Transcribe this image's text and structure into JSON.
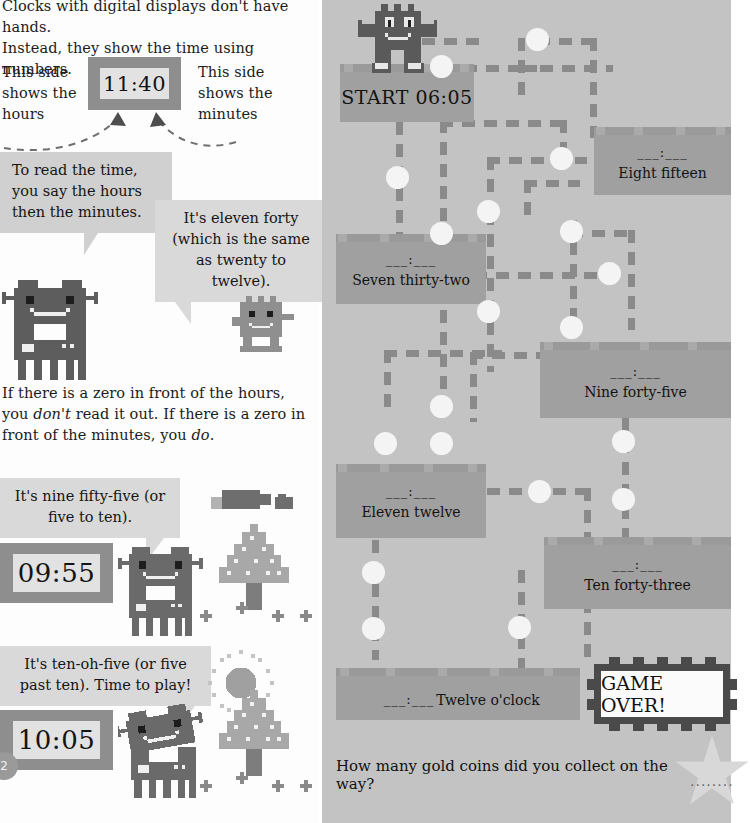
{
  "left_panel": {
    "intro_line1": "Clocks with digital displays don't have hands.",
    "intro_line2": "Instead, they show the time using numbers.",
    "label_hours": "This side shows the hours",
    "label_minutes": "This side shows the minutes",
    "clock_top_value": "11:40",
    "bubble_read_text": "To read the time, you say the hours then the minutes.",
    "bubble_eleven_text": "It's eleven forty (which is the same as twenty to twelve).",
    "zero_rule_part1": "If there is a zero in front of the hours, you ",
    "zero_rule_emph1": "don't",
    "zero_rule_part2": " read it out. If there is a zero in front of the minutes, you ",
    "zero_rule_emph2": "do",
    "zero_rule_part3": ".",
    "bubble_nine_text": "It's nine fifty-five (or five to ten).",
    "clock_0955_value": "09:55",
    "bubble_ten_text": "It's ten-oh-five (or five past ten). Time to play!",
    "clock_1005_value": "10:05",
    "page_number": "2"
  },
  "maze": {
    "platforms": [
      {
        "id": "start",
        "blank": "",
        "label": "START 06:05",
        "is_start": true
      },
      {
        "id": "eight",
        "blank": "___:___",
        "label": "Eight fifteen",
        "is_start": false
      },
      {
        "id": "seven",
        "blank": "___:___",
        "label": "Seven thirty-two",
        "is_start": false
      },
      {
        "id": "nine",
        "blank": "___:___",
        "label": "Nine forty-five",
        "is_start": false
      },
      {
        "id": "eleven",
        "blank": "___:___",
        "label": "Eleven twelve",
        "is_start": false
      },
      {
        "id": "ten",
        "blank": "___:___",
        "label": "Ten forty-three",
        "is_start": false
      },
      {
        "id": "twelve",
        "blank": "___:___",
        "label": "Twelve o'clock",
        "is_start": false
      }
    ],
    "game_over_label": "GAME OVER!",
    "question": "How many gold coins did you collect on the way?",
    "answer_dots": "........",
    "coin_count_visible": 19
  },
  "colors": {
    "page_background": "#ffffff",
    "maze_background": "#c3c3c3",
    "platform": "#a0a0a0",
    "platform_top": "#9a9a9a",
    "path_dash": "#8a8a8a",
    "coin": "#f4f4f4",
    "bubble": "#d9d9d9",
    "bubble_dark": "#d0d0d0",
    "clock_body": "#8e8e8e",
    "clock_screen": "#e2e2e2",
    "monster_dark": "#5d5d5d",
    "monster_mid": "#8f8f8f",
    "text": "#151515",
    "gameover_border": "#4a4a4a"
  }
}
